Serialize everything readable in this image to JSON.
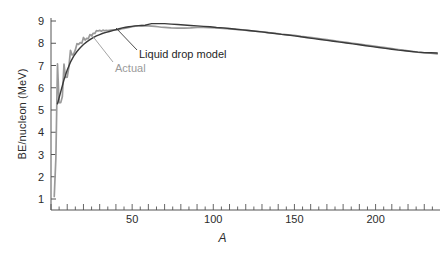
{
  "chart_data": {
    "type": "line",
    "title": "",
    "xlabel": "A",
    "ylabel": "BE/nucleon (MeV)",
    "xlim": [
      0,
      240
    ],
    "ylim": [
      0,
      9.4
    ],
    "grid": false,
    "legend_position": "inline-annotations",
    "x_ticks": [
      50,
      100,
      150,
      200
    ],
    "x_tick_labels": [
      "50",
      "100",
      "150",
      "200"
    ],
    "x_minor_tick_step": 5,
    "x_major_tick_step": 10,
    "y_ticks": [
      1,
      2,
      3,
      4,
      5,
      6,
      7,
      8,
      9
    ],
    "y_tick_labels": [
      "1",
      "2",
      "3",
      "4",
      "5",
      "6",
      "7",
      "8",
      "9"
    ],
    "annotations": [
      {
        "text": "Liquid drop model",
        "color": "#1f1f1f",
        "points_to_series": "Liquid drop model"
      },
      {
        "text": "Actual",
        "color": "#9a9a9a",
        "points_to_series": "Actual"
      }
    ],
    "series": [
      {
        "name": "Actual",
        "color": "#9a9a9a",
        "x": [
          2,
          3,
          4,
          5,
          6,
          7,
          8,
          9,
          10,
          11,
          12,
          13,
          14,
          15,
          16,
          17,
          18,
          19,
          20,
          21,
          22,
          23,
          24,
          25,
          26,
          27,
          28,
          29,
          30,
          31,
          32,
          33,
          34,
          35,
          36,
          38,
          40,
          42,
          44,
          46,
          48,
          50,
          52,
          54,
          56,
          58,
          60,
          62,
          64,
          66,
          68,
          70,
          74,
          78,
          82,
          86,
          90,
          94,
          98,
          102,
          106,
          110,
          114,
          118,
          122,
          126,
          130,
          134,
          138,
          142,
          146,
          150,
          154,
          158,
          162,
          166,
          170,
          174,
          178,
          182,
          186,
          190,
          194,
          198,
          202,
          206,
          210,
          214,
          218,
          222,
          226,
          230,
          234,
          238
        ],
        "y": [
          1.11,
          2.83,
          7.07,
          5.33,
          5.33,
          5.61,
          7.06,
          6.46,
          6.48,
          6.93,
          7.68,
          7.47,
          7.52,
          7.7,
          7.98,
          7.95,
          8.03,
          8.0,
          8.26,
          8.14,
          8.22,
          8.21,
          8.39,
          8.33,
          8.45,
          8.44,
          8.57,
          8.55,
          8.58,
          8.54,
          8.59,
          8.56,
          8.58,
          8.57,
          8.58,
          8.6,
          8.6,
          8.61,
          8.66,
          8.68,
          8.71,
          8.75,
          8.77,
          8.78,
          8.79,
          8.78,
          8.78,
          8.77,
          8.76,
          8.74,
          8.72,
          8.71,
          8.69,
          8.68,
          8.68,
          8.69,
          8.71,
          8.71,
          8.7,
          8.69,
          8.67,
          8.65,
          8.62,
          8.6,
          8.57,
          8.54,
          8.51,
          8.48,
          8.45,
          8.41,
          8.38,
          8.35,
          8.31,
          8.28,
          8.24,
          8.2,
          8.16,
          8.12,
          8.08,
          8.04,
          8.0,
          7.96,
          7.92,
          7.88,
          7.84,
          7.8,
          7.76,
          7.72,
          7.68,
          7.64,
          7.6,
          7.57,
          7.55,
          7.52
        ]
      },
      {
        "name": "Liquid drop model",
        "color": "#3a3a3a",
        "x": [
          4,
          6,
          8,
          10,
          12,
          14,
          16,
          18,
          20,
          22,
          24,
          26,
          28,
          30,
          32,
          34,
          36,
          38,
          40,
          42,
          44,
          46,
          48,
          50,
          52,
          54,
          56,
          58,
          60,
          62,
          64,
          66,
          68,
          70,
          74,
          78,
          82,
          86,
          90,
          94,
          98,
          102,
          106,
          110,
          114,
          118,
          122,
          126,
          130,
          134,
          138,
          142,
          146,
          150,
          154,
          158,
          162,
          166,
          170,
          174,
          178,
          182,
          186,
          190,
          194,
          198,
          202,
          206,
          210,
          214,
          218,
          222,
          226,
          230,
          234,
          238
        ],
        "y": [
          5.28,
          5.82,
          6.36,
          6.8,
          7.15,
          7.42,
          7.63,
          7.8,
          7.94,
          8.06,
          8.16,
          8.25,
          8.33,
          8.39,
          8.45,
          8.49,
          8.53,
          8.57,
          8.61,
          8.65,
          8.69,
          8.72,
          8.74,
          8.76,
          8.78,
          8.79,
          8.8,
          8.81,
          8.85,
          8.88,
          8.88,
          8.88,
          8.88,
          8.88,
          8.86,
          8.84,
          8.82,
          8.8,
          8.78,
          8.76,
          8.74,
          8.71,
          8.69,
          8.66,
          8.63,
          8.6,
          8.57,
          8.54,
          8.51,
          8.47,
          8.44,
          8.4,
          8.37,
          8.33,
          8.29,
          8.25,
          8.21,
          8.17,
          8.13,
          8.09,
          8.05,
          8.01,
          7.97,
          7.93,
          7.89,
          7.85,
          7.81,
          7.77,
          7.73,
          7.69,
          7.66,
          7.63,
          7.6,
          7.58,
          7.57,
          7.56
        ]
      }
    ]
  },
  "axes": {
    "y_title": "BE/nucleon (MeV)",
    "x_title": "A"
  }
}
